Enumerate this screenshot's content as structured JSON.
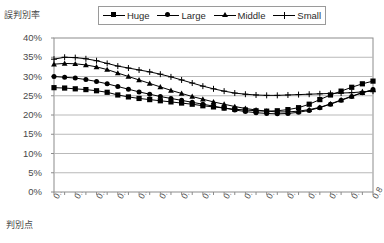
{
  "titles": {
    "y_axis_title": "誤判別率",
    "x_axis_title": "判別点"
  },
  "legend": {
    "position": "top",
    "items": [
      {
        "label": "Huge",
        "marker": "square-marker"
      },
      {
        "label": "Large",
        "marker": "circle-marker"
      },
      {
        "label": "Middle",
        "marker": "triangle-marker"
      },
      {
        "label": "Small",
        "marker": "cross-marker"
      }
    ]
  },
  "axes": {
    "y_ticks": [
      "40%",
      "35%",
      "30%",
      "25%",
      "20%",
      "15%",
      "10%",
      "5%",
      "0%"
    ],
    "x_ticks": [
      "0.5",
      "0.52",
      "0.54",
      "0.56",
      "0.58",
      "0.6",
      "0.62",
      "0.64",
      "0.66",
      "0.68",
      "0.7",
      "0.72",
      "0.74",
      "0.76",
      "0.78",
      "0.8"
    ]
  },
  "chart_data": {
    "type": "line",
    "title": "",
    "xlabel": "判別点",
    "ylabel": "誤判別率",
    "xlim": [
      0.5,
      0.8
    ],
    "ylim": [
      0,
      0.4
    ],
    "ytick_step": 0.05,
    "grid": true,
    "legend_position": "top",
    "x": [
      0.5,
      0.51,
      0.52,
      0.53,
      0.54,
      0.55,
      0.56,
      0.57,
      0.58,
      0.59,
      0.6,
      0.61,
      0.62,
      0.63,
      0.64,
      0.65,
      0.66,
      0.67,
      0.68,
      0.69,
      0.7,
      0.71,
      0.72,
      0.73,
      0.74,
      0.75,
      0.76,
      0.77,
      0.78,
      0.79,
      0.8
    ],
    "series": [
      {
        "name": "Huge",
        "marker": "square-marker",
        "values": [
          0.271,
          0.27,
          0.268,
          0.266,
          0.263,
          0.259,
          0.252,
          0.247,
          0.243,
          0.24,
          0.237,
          0.234,
          0.231,
          0.228,
          0.224,
          0.221,
          0.218,
          0.215,
          0.213,
          0.211,
          0.21,
          0.211,
          0.214,
          0.219,
          0.228,
          0.24,
          0.252,
          0.262,
          0.272,
          0.281,
          0.288
        ]
      },
      {
        "name": "Large",
        "marker": "circle-marker",
        "values": [
          0.3,
          0.298,
          0.296,
          0.292,
          0.287,
          0.281,
          0.274,
          0.267,
          0.26,
          0.254,
          0.248,
          0.243,
          0.238,
          0.233,
          0.228,
          0.223,
          0.218,
          0.213,
          0.209,
          0.206,
          0.204,
          0.203,
          0.204,
          0.207,
          0.212,
          0.219,
          0.228,
          0.238,
          0.248,
          0.258,
          0.266
        ]
      },
      {
        "name": "Middle",
        "marker": "triangle-marker",
        "values": [
          0.332,
          0.334,
          0.333,
          0.33,
          0.325,
          0.318,
          0.309,
          0.3,
          0.291,
          0.282,
          0.273,
          0.264,
          0.256,
          0.248,
          0.241,
          0.234,
          0.228,
          0.222,
          0.217,
          0.213,
          0.21,
          0.208,
          0.208,
          0.21,
          0.214,
          0.22,
          0.229,
          0.239,
          0.249,
          0.258,
          0.265
        ]
      },
      {
        "name": "Small",
        "marker": "cross-marker",
        "values": [
          0.345,
          0.35,
          0.349,
          0.346,
          0.341,
          0.334,
          0.327,
          0.322,
          0.317,
          0.312,
          0.306,
          0.299,
          0.291,
          0.283,
          0.275,
          0.268,
          0.262,
          0.257,
          0.254,
          0.252,
          0.251,
          0.251,
          0.252,
          0.253,
          0.254,
          0.255,
          0.256,
          0.257,
          0.258,
          0.26,
          0.262
        ]
      }
    ]
  }
}
